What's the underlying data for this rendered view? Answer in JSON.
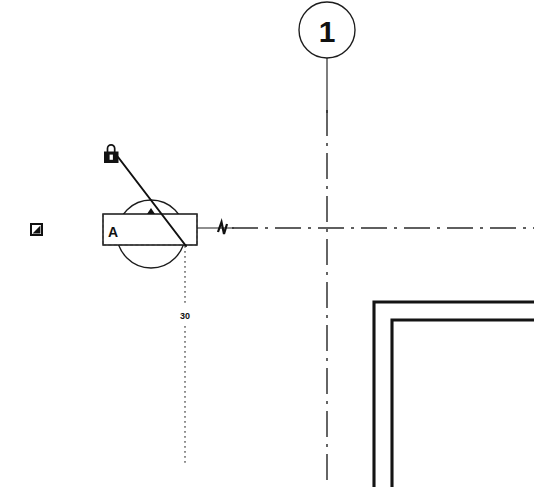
{
  "drawing": {
    "title": "Architectural Plan Detail",
    "background_color": "#ffffff",
    "line_color": "#1a1a1a",
    "width": 534,
    "height": 487
  },
  "grid_bubble": {
    "label": "1",
    "icon_name": "grid-bubble-circle",
    "cx": 327,
    "cy": 30,
    "r": 28,
    "leader_from_y": 58,
    "leader_to_y": 110
  },
  "centerlines": {
    "vertical": {
      "x": 327,
      "y1": 110,
      "y2": 487
    },
    "horizontal": {
      "y": 228,
      "x1": 232,
      "x2": 534
    },
    "pattern": "dash-dot"
  },
  "section_marker": {
    "letter": "A",
    "rect": {
      "x": 103,
      "y": 214,
      "w": 94,
      "h": 31
    },
    "circle": {
      "cx": 151,
      "cy": 234,
      "r": 34
    },
    "tail_line": {
      "x1": 197,
      "y1": 228,
      "x2": 232,
      "y2": 228
    },
    "dashed_edge": true
  },
  "padlock": {
    "icon_name": "padlock-icon",
    "x": 104,
    "y": 146,
    "w": 15,
    "h": 16,
    "leader": {
      "x1": 118,
      "y1": 156,
      "x2": 186,
      "y2": 246
    }
  },
  "checkbox": {
    "icon_name": "checkbox-checked-icon",
    "x": 30,
    "y": 223,
    "size": 13
  },
  "break_symbol": {
    "icon_name": "line-break-symbol",
    "x": 222,
    "y": 228
  },
  "dimension": {
    "value": "30",
    "label_x": 185,
    "label_y": 315,
    "line": {
      "x": 185,
      "y1": 246,
      "y2": 466
    },
    "style": "dotted"
  },
  "walls": {
    "outer": {
      "x_vert": 374,
      "y_horz": 302,
      "x_end": 534,
      "y_end": 487
    },
    "inner": {
      "x_vert": 392,
      "y_horz": 320,
      "x_end": 534,
      "y_end": 487
    },
    "stroke_width": 3.1,
    "color": "#141414"
  }
}
